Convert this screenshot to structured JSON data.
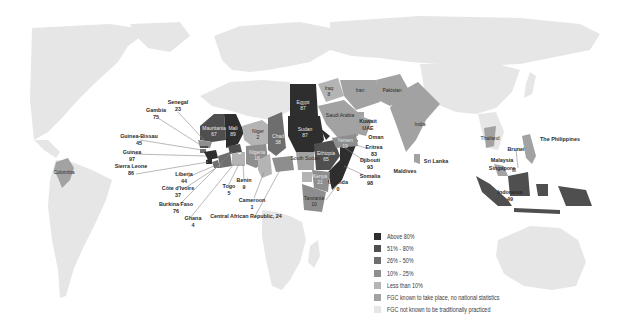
{
  "colors": {
    "above_80": "#2e2e2e",
    "51_80": "#4f4f4f",
    "26_50": "#6e6e6e",
    "10_25": "#8e8e8e",
    "less_10": "#b4b4b4",
    "no_stats": "#a2a2a2",
    "not_practiced": "#e6e6e6",
    "ocean": "#ffffff"
  },
  "legend": {
    "items": [
      {
        "label": "Above 80%",
        "color": "#2e2e2e"
      },
      {
        "label": "51% - 80%",
        "color": "#4f4f4f"
      },
      {
        "label": "26% - 50%",
        "color": "#6e6e6e"
      },
      {
        "label": "10% - 25%",
        "color": "#8e8e8e"
      },
      {
        "label": "Less than 10%",
        "color": "#b4b4b4"
      },
      {
        "label": "FGC known to take place, no national statistics",
        "color": "#a2a2a2"
      },
      {
        "label": "FGC not known to be traditionally practiced",
        "color": "#e6e6e6"
      }
    ]
  },
  "countries": {
    "senegal": {
      "name": "Senegal",
      "value": "23"
    },
    "gambia": {
      "name": "Gambia",
      "value": "75"
    },
    "guinea_bissau": {
      "name": "Guinea-Bissau",
      "value": "45"
    },
    "guinea": {
      "name": "Guinea",
      "value": "97"
    },
    "sierra_leone": {
      "name": "Sierra Leone",
      "value": "86"
    },
    "liberia": {
      "name": "Liberia",
      "value": "44"
    },
    "cote_divoire": {
      "name": "Côte d'Ivoire",
      "value": "37"
    },
    "burkina_faso": {
      "name": "Burkina Faso",
      "value": "76"
    },
    "ghana": {
      "name": "Ghana",
      "value": "4"
    },
    "togo": {
      "name": "Togo",
      "value": "5"
    },
    "benin": {
      "name": "Benin",
      "value": "9"
    },
    "cameroon": {
      "name": "Cameroon",
      "value": "1"
    },
    "car": {
      "name": "Central African Republic, 24",
      "value": ""
    },
    "mauritania": {
      "name": "Mauritania",
      "value": "67"
    },
    "mali": {
      "name": "Mali",
      "value": "89"
    },
    "niger": {
      "name": "Niger",
      "value": "2"
    },
    "nigeria": {
      "name": "Nigeria",
      "value": "18"
    },
    "chad": {
      "name": "Chad",
      "value": "38"
    },
    "egypt": {
      "name": "Egypt",
      "value": "87"
    },
    "sudan": {
      "name": "Sudan",
      "value": "87"
    },
    "south_sudan": {
      "name": "South Sudan",
      "value": ""
    },
    "ethiopia": {
      "name": "Ethiopia",
      "value": "65"
    },
    "kenya": {
      "name": "Kenya",
      "value": "21"
    },
    "tanzania": {
      "name": "Tanzania",
      "value": "10"
    },
    "uganda": {
      "name": "Uganda",
      "value": "0"
    },
    "somalia": {
      "name": "Somalia",
      "value": "98"
    },
    "djibouti": {
      "name": "Djibouti",
      "value": "93"
    },
    "eritrea": {
      "name": "Eritrea",
      "value": "83"
    },
    "yemen": {
      "name": "Yemen",
      "value": "19"
    },
    "iraq": {
      "name": "Iraq",
      "value": "8"
    },
    "iran": {
      "name": "Iran",
      "value": ""
    },
    "saudi_arabia": {
      "name": "Saudi Arabia",
      "value": ""
    },
    "kuwait": {
      "name": "Kuwait",
      "value": ""
    },
    "uae": {
      "name": "UAE",
      "value": ""
    },
    "oman": {
      "name": "Oman",
      "value": ""
    },
    "pakistan": {
      "name": "Pakistan",
      "value": ""
    },
    "india": {
      "name": "India",
      "value": ""
    },
    "maldives": {
      "name": "Maldives",
      "value": ""
    },
    "sri_lanka": {
      "name": "Sri Lanka",
      "value": ""
    },
    "thailand": {
      "name": "Thailand",
      "value": ""
    },
    "malaysia": {
      "name": "Malaysia",
      "value": ""
    },
    "singapore": {
      "name": "Singapore",
      "value": ""
    },
    "brunei": {
      "name": "Brunei",
      "value": ""
    },
    "philippines": {
      "name": "The Philippines",
      "value": ""
    },
    "indonesia": {
      "name": "Indonesia",
      "value": "49"
    },
    "colombia": {
      "name": "Colombia",
      "value": ""
    }
  }
}
